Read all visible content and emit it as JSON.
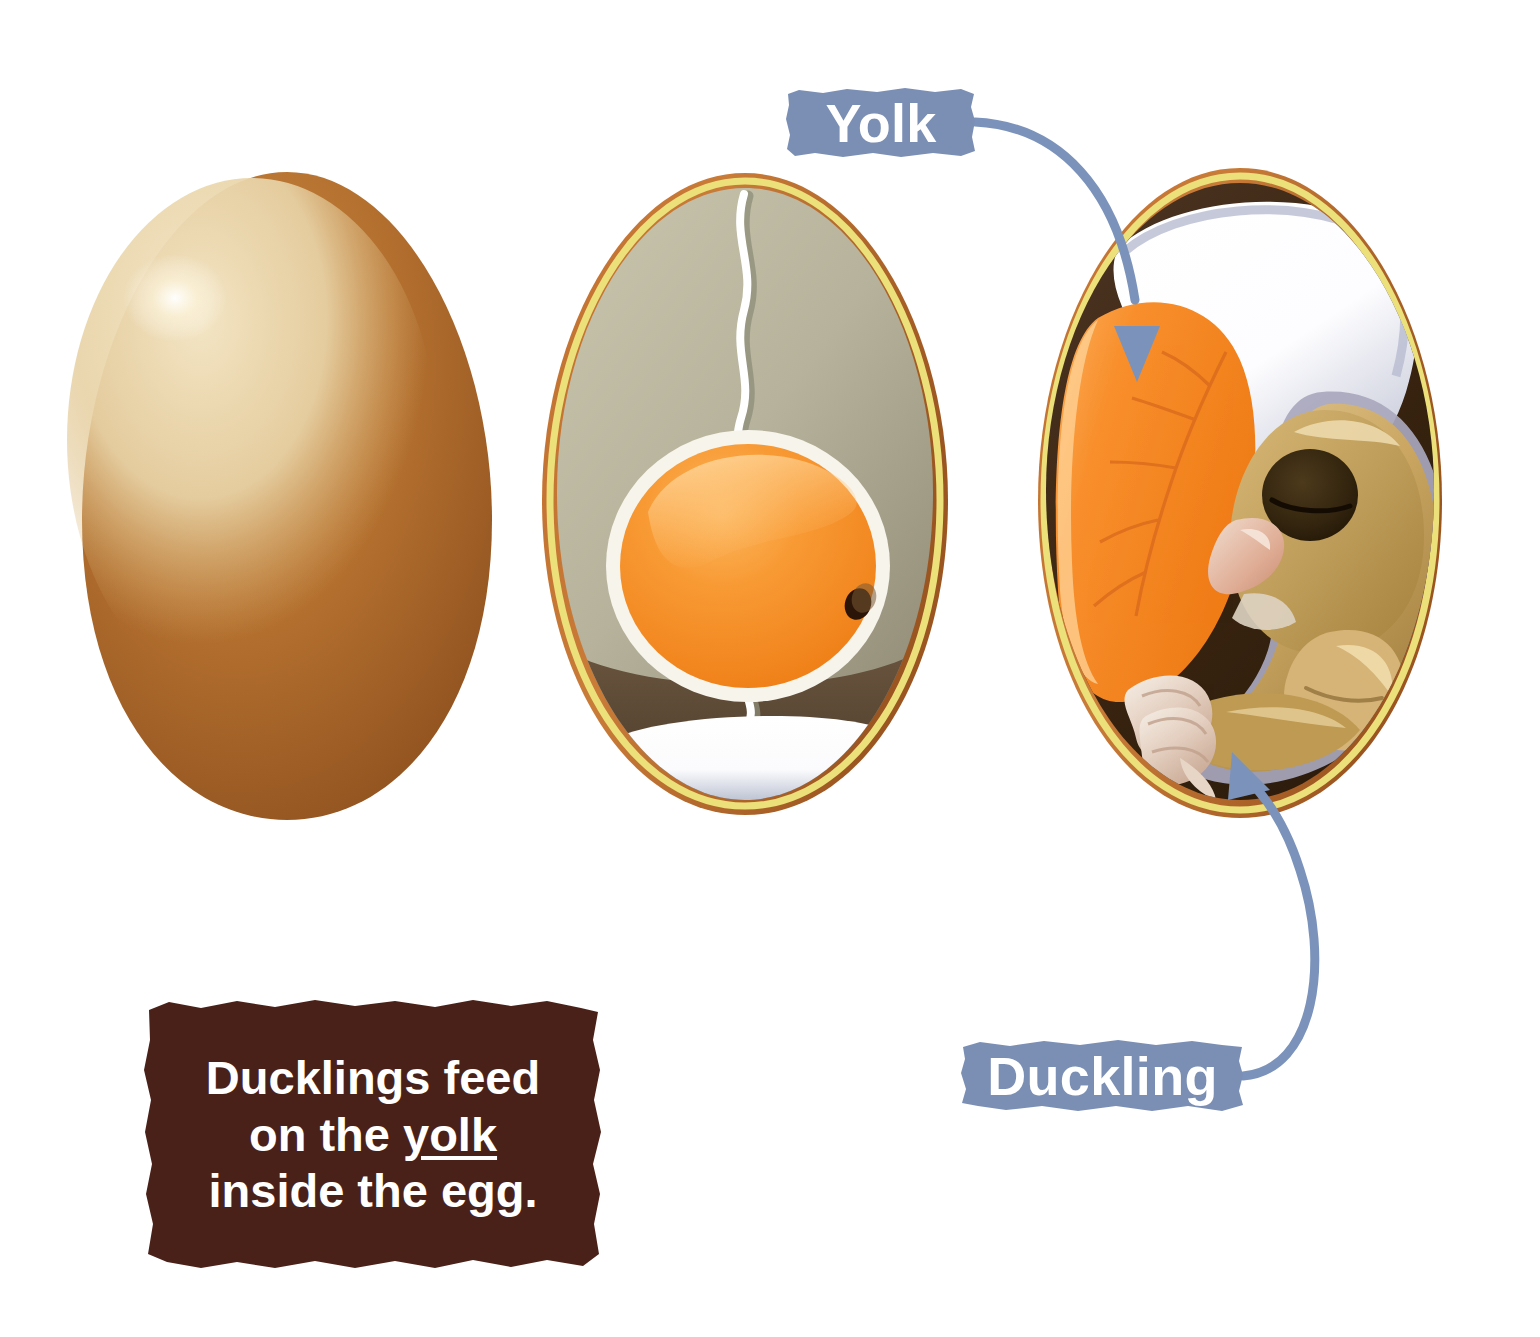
{
  "diagram": {
    "background_color": "#ffffff"
  },
  "callouts": [
    {
      "id": "yolk",
      "label": "Yolk",
      "chip_color": "#7b8fb5",
      "text_color": "#ffffff",
      "arrow_color": "#7b93bb",
      "points_to": "yolk-sac-in-embryo-egg"
    },
    {
      "id": "duckling",
      "label": "Duckling",
      "chip_color": "#7b8fb5",
      "text_color": "#ffffff",
      "arrow_color": "#7b93bb",
      "points_to": "duckling-embryo"
    }
  ],
  "fact_box": {
    "line1": "Ducklings feed",
    "line2_before": "on the ",
    "line2_underlined": "yolk",
    "line3": "inside the egg.",
    "background_color": "#4a2118",
    "text_color": "#ffffff"
  },
  "eggs": [
    {
      "id": "whole-egg",
      "name": "Whole brown duck egg",
      "shell_color": "#b5712f",
      "shell_dark": "#8d4f1f",
      "highlight_color": "#eddcb3",
      "specular_color": "#ffffff",
      "parts": [
        "shell"
      ]
    },
    {
      "id": "unfertilised-egg",
      "name": "Egg cross-section with yolk",
      "shell_color": "#c97434",
      "membrane_color": "#ece07a",
      "albumen_color": "#b5b09a",
      "albumen_dark": "#5d4a35",
      "yolk_color": "#f58220",
      "yolk_light": "#fbb45c",
      "yolk_rim_color": "#f5f2ea",
      "germinal_disc_color": "#2b1508",
      "chalaza_color": "#ffffff",
      "air_cell_color": "#ffffff",
      "parts": [
        "shell",
        "membrane",
        "albumen",
        "chalaza",
        "yolk",
        "germinal disc",
        "air cell"
      ]
    },
    {
      "id": "embryo-egg",
      "name": "Egg cross-section with duckling embryo",
      "shell_color": "#c97434",
      "membrane_color": "#ece07a",
      "interior_color": "#3a2413",
      "yolk_sac_color": "#f58220",
      "yolk_vein_color": "#d8681d",
      "air_cell_color": "#ffffff",
      "amnion_color": "#a9a7bd",
      "duckling_body_color": "#c9a25d",
      "duckling_light_color": "#e6cfa0",
      "duckling_dark_color": "#8a6a33",
      "beak_color": "#e6b9a6",
      "eye_color": "#3a2a12",
      "foot_color": "#e8d9c8",
      "parts": [
        "shell",
        "membrane",
        "air cell",
        "yolk sac",
        "veins",
        "amnion",
        "duckling"
      ]
    }
  ]
}
